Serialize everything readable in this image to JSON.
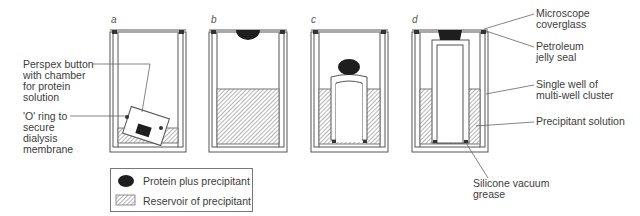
{
  "panels": [
    {
      "id": "a",
      "label": "a"
    },
    {
      "id": "b",
      "label": "b"
    },
    {
      "id": "c",
      "label": "c"
    },
    {
      "id": "d",
      "label": "d"
    }
  ],
  "left_annotations": {
    "perspex_button": [
      "Perspex button",
      "with chamber",
      "for protein",
      "solution"
    ],
    "o_ring": [
      "'O' ring to",
      "secure",
      "dialysis",
      "membrane"
    ]
  },
  "right_annotations": {
    "coverglass": [
      "Microscope",
      "coverglass"
    ],
    "seal": [
      "Petroleum",
      "jelly seal"
    ],
    "well": [
      "Single well of",
      "multi-well cluster"
    ],
    "precipitant": [
      "Precipitant solution"
    ],
    "grease": [
      "Silicone vacuum",
      "grease"
    ]
  },
  "legend": {
    "protein": "Protein plus precipitant",
    "reservoir": "Reservoir of precipitant"
  },
  "colors": {
    "line": "#555555",
    "drop": "#1e1e1e",
    "hatch": "#6a6a6a"
  }
}
